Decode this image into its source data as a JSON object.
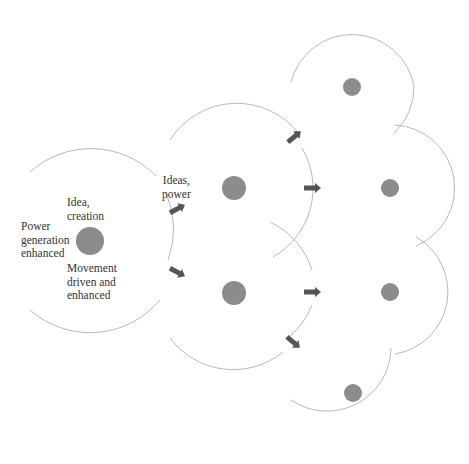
{
  "colors": {
    "circle_stroke": "#b8b8b8",
    "node_fill": "#8c8c8c",
    "arrow_fill": "#555555",
    "text": "#333333"
  },
  "labels": {
    "idea_creation": "Idea,\ncreation",
    "power_generation": "Power\ngeneration\nenhanced",
    "movement": "Movement\ndriven and\nenhanced",
    "ideas_power": "Ideas,\npower"
  },
  "nodes": [
    {
      "id": "origin",
      "cx": 90,
      "cy": 241,
      "r": 91,
      "dot_r": 14
    },
    {
      "id": "mid-upper",
      "cx": 234,
      "cy": 188,
      "r": 79,
      "dot_r": 12
    },
    {
      "id": "mid-lower",
      "cx": 234,
      "cy": 293,
      "r": 79,
      "dot_r": 12
    },
    {
      "id": "top",
      "cx": 352,
      "cy": 87,
      "r": 63,
      "dot_r": 9
    },
    {
      "id": "right-upper",
      "cx": 390,
      "cy": 188,
      "r": 63,
      "dot_r": 9
    },
    {
      "id": "right-lower",
      "cx": 390,
      "cy": 292,
      "r": 63,
      "dot_r": 9
    },
    {
      "id": "bottom",
      "cx": 353,
      "cy": 393,
      "r": 64,
      "dot_r": 9
    }
  ],
  "arrows": [
    {
      "x": 176,
      "y": 207,
      "angle": -28
    },
    {
      "x": 176,
      "y": 273,
      "angle": 28
    },
    {
      "x": 294,
      "y": 138,
      "angle": -40
    },
    {
      "x": 309,
      "y": 188,
      "angle": 0
    },
    {
      "x": 309,
      "y": 293,
      "angle": 0
    },
    {
      "x": 293,
      "y": 343,
      "angle": 40
    }
  ]
}
